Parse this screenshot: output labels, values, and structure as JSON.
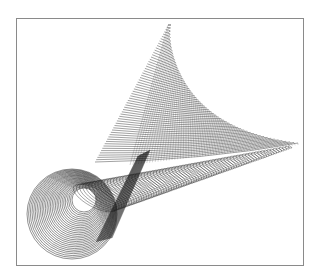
{
  "figure": {
    "caption": "",
    "stroke_color": "#1a1a1a",
    "frame_color": "#8a8a8a",
    "background": "#ffffff",
    "landmarks": {
      "apex": [
        168,
        25
      ],
      "right_tip": [
        298,
        143
      ],
      "sheet_lower_left": [
        95,
        162
      ],
      "cone_center": [
        72,
        214
      ],
      "cone_outer_radius": 45
    },
    "sheet_line_count": 60,
    "cone_circle_count": 28
  }
}
